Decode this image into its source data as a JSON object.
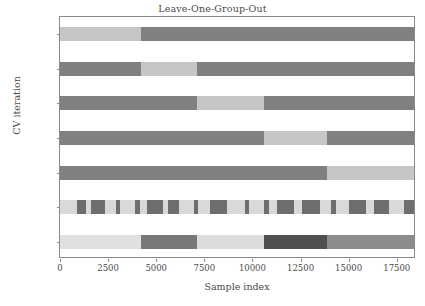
{
  "chart_data": {
    "type": "heatmap",
    "title": "Leave-One-Group-Out",
    "xlabel": "Sample index",
    "ylabel": "CV iteration",
    "xlim": [
      0,
      18500
    ],
    "ylim_rows": 7,
    "grid": false,
    "legend": "none",
    "xticks": [
      0,
      2500,
      5000,
      7500,
      10000,
      12500,
      15000,
      17500
    ],
    "xticklabels": [
      "0",
      "2500",
      "5000",
      "7500",
      "10000",
      "12500",
      "15000",
      "17500"
    ],
    "yticklabels": [
      "0",
      "1",
      "2",
      "3",
      "4",
      "class",
      "group"
    ],
    "colors": {
      "train": "#808080",
      "test": "#c6c6c6",
      "class_0": "#d9d9d9",
      "class_1": "#6e6e6e",
      "group_0": "#e0e0e0",
      "group_1": "#787878",
      "group_2": "#dcdcdc",
      "group_3": "#4f4f4f",
      "group_4": "#8c8c8c",
      "spine": "#8a8a8a",
      "text": "#4a4a4a",
      "background": "#ffffff"
    },
    "group_boundaries": [
      0,
      4200,
      7100,
      10600,
      13900,
      18500
    ],
    "cv_rows": [
      {
        "label": "0",
        "segments": [
          {
            "start": 0,
            "end": 4200,
            "role": "test"
          },
          {
            "start": 4200,
            "end": 18500,
            "role": "train"
          }
        ]
      },
      {
        "label": "1",
        "segments": [
          {
            "start": 0,
            "end": 4200,
            "role": "train"
          },
          {
            "start": 4200,
            "end": 7100,
            "role": "test"
          },
          {
            "start": 7100,
            "end": 18500,
            "role": "train"
          }
        ]
      },
      {
        "label": "2",
        "segments": [
          {
            "start": 0,
            "end": 7100,
            "role": "train"
          },
          {
            "start": 7100,
            "end": 10600,
            "role": "test"
          },
          {
            "start": 10600,
            "end": 18500,
            "role": "train"
          }
        ]
      },
      {
        "label": "3",
        "segments": [
          {
            "start": 0,
            "end": 10600,
            "role": "train"
          },
          {
            "start": 10600,
            "end": 13900,
            "role": "test"
          },
          {
            "start": 13900,
            "end": 18500,
            "role": "train"
          }
        ]
      },
      {
        "label": "4",
        "segments": [
          {
            "start": 0,
            "end": 13900,
            "role": "train"
          },
          {
            "start": 13900,
            "end": 18500,
            "role": "test"
          }
        ]
      }
    ],
    "class_row": {
      "label": "class",
      "segments": [
        {
          "start": 0,
          "end": 900,
          "value": 0
        },
        {
          "start": 900,
          "end": 1350,
          "value": 1
        },
        {
          "start": 1350,
          "end": 1600,
          "value": 0
        },
        {
          "start": 1600,
          "end": 2350,
          "value": 1
        },
        {
          "start": 2350,
          "end": 2900,
          "value": 0
        },
        {
          "start": 2900,
          "end": 3100,
          "value": 1
        },
        {
          "start": 3100,
          "end": 3900,
          "value": 0
        },
        {
          "start": 3900,
          "end": 4150,
          "value": 1
        },
        {
          "start": 4150,
          "end": 4500,
          "value": 0
        },
        {
          "start": 4500,
          "end": 5350,
          "value": 1
        },
        {
          "start": 5350,
          "end": 5600,
          "value": 0
        },
        {
          "start": 5600,
          "end": 6200,
          "value": 1
        },
        {
          "start": 6200,
          "end": 6950,
          "value": 0
        },
        {
          "start": 6950,
          "end": 7150,
          "value": 1
        },
        {
          "start": 7150,
          "end": 7800,
          "value": 0
        },
        {
          "start": 7800,
          "end": 8700,
          "value": 1
        },
        {
          "start": 8700,
          "end": 9600,
          "value": 0
        },
        {
          "start": 9600,
          "end": 9800,
          "value": 1
        },
        {
          "start": 9800,
          "end": 10600,
          "value": 0
        },
        {
          "start": 10600,
          "end": 10850,
          "value": 1
        },
        {
          "start": 10850,
          "end": 11300,
          "value": 0
        },
        {
          "start": 11300,
          "end": 12150,
          "value": 1
        },
        {
          "start": 12150,
          "end": 12600,
          "value": 0
        },
        {
          "start": 12600,
          "end": 13500,
          "value": 1
        },
        {
          "start": 13500,
          "end": 14100,
          "value": 0
        },
        {
          "start": 14100,
          "end": 14350,
          "value": 1
        },
        {
          "start": 14350,
          "end": 15000,
          "value": 0
        },
        {
          "start": 15000,
          "end": 15900,
          "value": 1
        },
        {
          "start": 15900,
          "end": 16300,
          "value": 0
        },
        {
          "start": 16300,
          "end": 17100,
          "value": 1
        },
        {
          "start": 17100,
          "end": 17900,
          "value": 0
        },
        {
          "start": 17900,
          "end": 18500,
          "value": 1
        }
      ]
    },
    "group_row": {
      "label": "group",
      "segments": [
        {
          "start": 0,
          "end": 4200,
          "value": 0
        },
        {
          "start": 4200,
          "end": 7100,
          "value": 1
        },
        {
          "start": 7100,
          "end": 10600,
          "value": 2
        },
        {
          "start": 10600,
          "end": 13900,
          "value": 3
        },
        {
          "start": 13900,
          "end": 18500,
          "value": 4
        }
      ]
    }
  }
}
